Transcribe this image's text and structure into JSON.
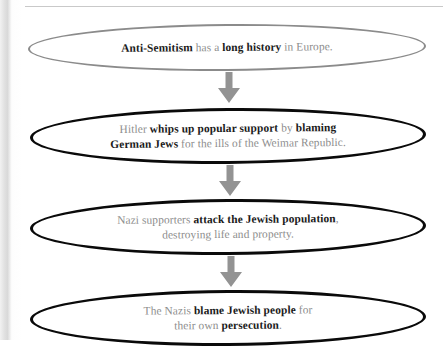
{
  "diagram": {
    "type": "vertical-flowchart",
    "background_color": "#ffffff",
    "arrow_color": "#8f8f8f",
    "body_text_color": "#8d8d8d",
    "emphasis_text_color": "#1b1b1b",
    "nodes": [
      {
        "id": "node-1",
        "shape": "ellipse",
        "border_color": "#8b8b8b",
        "border_weight": "thin",
        "lines": [
          [
            {
              "text": "Anti-Semitism",
              "bold": true
            },
            {
              "text": " has a ",
              "bold": false
            },
            {
              "text": "long history",
              "bold": true
            },
            {
              "text": " in Europe.",
              "bold": false
            }
          ]
        ],
        "plain_text": "Anti-Semitism has a long history in Europe."
      },
      {
        "id": "node-2",
        "shape": "ellipse",
        "border_color": "#0a0a0a",
        "border_weight": "thick",
        "lines": [
          [
            {
              "text": "Hitler ",
              "bold": false
            },
            {
              "text": "whips up popular support",
              "bold": true
            },
            {
              "text": " by ",
              "bold": false
            },
            {
              "text": "blaming",
              "bold": true
            }
          ],
          [
            {
              "text": "German Jews",
              "bold": true
            },
            {
              "text": " for the ills of the Weimar Republic.",
              "bold": false
            }
          ]
        ],
        "plain_text": "Hitler whips up popular support by blaming German Jews for the ills of the Weimar Republic."
      },
      {
        "id": "node-3",
        "shape": "ellipse",
        "border_color": "#0a0a0a",
        "border_weight": "thick",
        "lines": [
          [
            {
              "text": "Nazi supporters ",
              "bold": false
            },
            {
              "text": "attack the Jewish population",
              "bold": true
            },
            {
              "text": ",",
              "bold": false
            }
          ],
          [
            {
              "text": "destroying life and property.",
              "bold": false
            }
          ]
        ],
        "plain_text": "Nazi supporters attack the Jewish population, destroying life and property."
      },
      {
        "id": "node-4",
        "shape": "ellipse",
        "border_color": "#0a0a0a",
        "border_weight": "thick",
        "lines": [
          [
            {
              "text": "The Nazis ",
              "bold": false
            },
            {
              "text": "blame Jewish people",
              "bold": true
            },
            {
              "text": " for",
              "bold": false
            }
          ],
          [
            {
              "text": "their own ",
              "bold": false
            },
            {
              "text": "persecution",
              "bold": true
            },
            {
              "text": ".",
              "bold": false
            }
          ]
        ],
        "plain_text": "The Nazis blame Jewish people for their own persecution."
      }
    ],
    "connectors": [
      {
        "id": "arrow-1",
        "icon": "arrow-down-icon",
        "from": "node-1",
        "to": "node-2"
      },
      {
        "id": "arrow-2",
        "icon": "arrow-down-icon",
        "from": "node-2",
        "to": "node-3"
      },
      {
        "id": "arrow-3",
        "icon": "arrow-down-icon",
        "from": "node-3",
        "to": "node-4"
      }
    ]
  }
}
